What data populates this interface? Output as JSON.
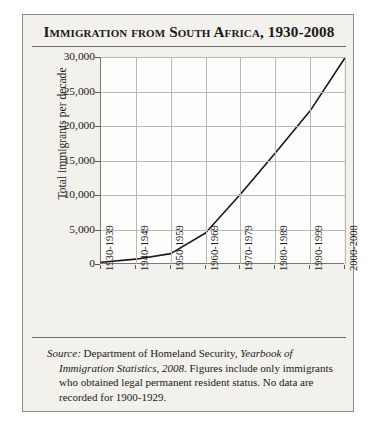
{
  "figure": {
    "title": "Immigration from South Africa, 1930-2008",
    "background_color": "#f3f1ec",
    "border_color": "#8e8c88",
    "line_color": "#1a1a1a",
    "grid_color": "#b9b7b3"
  },
  "source_note": {
    "label": "Source:",
    "publisher": " Department of Homeland Security, ",
    "publication": "Yearbook of Immigration Statistics, 2008",
    "rest": ". Figures include only immigrants who obtained legal permanent resident status. No data are recorded for 1900-1929."
  },
  "chart_data": {
    "type": "line",
    "title": "Immigration from South Africa, 1930-2008",
    "xlabel": "",
    "ylabel": "Total immigrants per decade",
    "categories": [
      "1930-1939",
      "1940-1949",
      "1950-1959",
      "1960-1969",
      "1970-1979",
      "1980-1989",
      "1990-1999",
      "2000-2008"
    ],
    "values": [
      250,
      700,
      1500,
      4500,
      10100,
      16100,
      22200,
      29900
    ],
    "ylim": [
      0,
      30000
    ],
    "ytick_values": [
      0,
      5000,
      10000,
      15000,
      20000,
      25000,
      30000
    ],
    "ytick_labels": [
      "0",
      "5,000",
      "10,000",
      "15,000",
      "20,000",
      "25,000",
      "30,000"
    ],
    "grid": true,
    "legend": false
  }
}
